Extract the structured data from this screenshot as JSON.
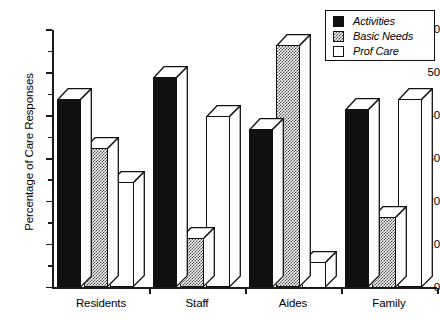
{
  "chart_data": {
    "type": "bar",
    "title": "",
    "xlabel": "",
    "ylabel": "Percentage of Care Responses",
    "categories": [
      "Residents",
      "Staff",
      "Aides",
      "Family"
    ],
    "series": [
      {
        "name": "Activities",
        "pattern": "solid-black",
        "values": [
          44,
          49,
          37,
          41.5
        ]
      },
      {
        "name": "Basic Needs",
        "pattern": "stippled",
        "values": [
          32.5,
          11.5,
          56.5,
          16.5
        ]
      },
      {
        "name": "Prof Care",
        "pattern": "open-white",
        "values": [
          24.5,
          40,
          6,
          44
        ]
      }
    ],
    "ylim": [
      0,
      60
    ],
    "ytick_labels": [
      "0",
      "10",
      "20",
      "30",
      "40",
      "50",
      "60"
    ],
    "ytick_values": [
      0,
      10,
      20,
      30,
      40,
      50,
      60
    ],
    "yminor_values": [
      5,
      15,
      25,
      35,
      45,
      55
    ],
    "grid": false,
    "legend_position": "top-right",
    "style": "3d-bars-monochrome"
  },
  "legend": {
    "items": [
      {
        "label": "Activities"
      },
      {
        "label": "Basic Needs"
      },
      {
        "label": "Prof Care"
      }
    ]
  }
}
